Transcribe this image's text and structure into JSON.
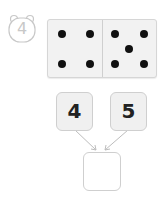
{
  "problem": {
    "number": "4",
    "badge_icon": "bear-face-icon"
  },
  "domino": {
    "left_pips": 4,
    "right_pips": 5,
    "pip_color": "#111111"
  },
  "addends": [
    {
      "value": "4"
    },
    {
      "value": "5"
    }
  ],
  "answer": {
    "value": ""
  }
}
